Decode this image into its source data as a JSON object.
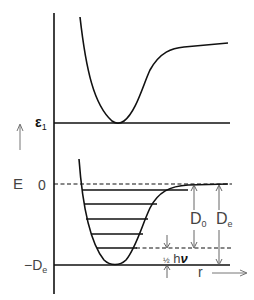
{
  "diagram": {
    "type": "potential-energy-curves",
    "axis": {
      "y_label": "E",
      "x_label": "r"
    },
    "upper_curve": {
      "level_label": "ε",
      "level_subscript": "1"
    },
    "lower_curve": {
      "zero_label": "0",
      "min_label": "−D",
      "min_subscript": "e",
      "vibrational_levels": 5,
      "annotations": {
        "D0": {
          "main": "D",
          "sub": "0"
        },
        "De": {
          "main": "D",
          "sub": "e"
        },
        "zero_point": {
          "fraction": "½",
          "text": "h",
          "symbol": "ν"
        }
      }
    },
    "colors": {
      "line": "#111111",
      "label": "#444444",
      "background": "#ffffff"
    }
  }
}
